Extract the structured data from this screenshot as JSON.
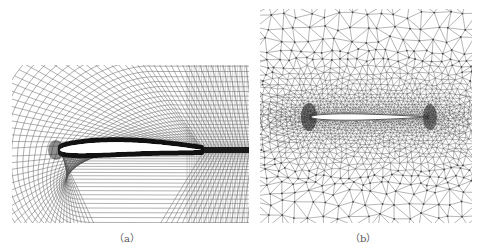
{
  "figure": {
    "panels": [
      {
        "id": "a",
        "caption": "（a）",
        "description": "Structured C-type grid around an airfoil",
        "mesh_type": "structured",
        "line_color": "#3a3a3a"
      },
      {
        "id": "b",
        "caption": "（b）",
        "description": "Unstructured triangular grid around an airfoil",
        "mesh_type": "unstructured-triangular",
        "line_color": "#3a3a3a"
      }
    ],
    "colors": {
      "background": "#ffffff",
      "mesh": "#333333",
      "airfoil": "#ffffff"
    }
  }
}
